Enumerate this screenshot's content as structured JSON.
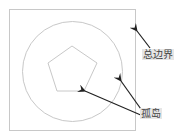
{
  "diagram": {
    "labels": {
      "outer_boundary": "总边界",
      "island": "孤岛"
    },
    "colors": {
      "shape_stroke": "#c8c8c8",
      "arrow": "#222222",
      "label_bg": "#e6e6e6",
      "label_text": "#444444"
    },
    "shapes": [
      {
        "type": "square",
        "name": "outer-boundary"
      },
      {
        "type": "circle",
        "name": "island-circle"
      },
      {
        "type": "pentagon",
        "name": "island-pentagon"
      }
    ]
  }
}
